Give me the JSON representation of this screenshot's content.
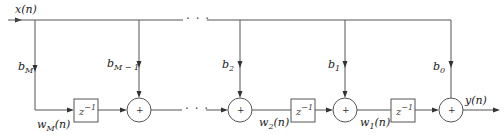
{
  "diagram": {
    "type": "transposed direct-form FIR/IIR filter structure (block diagram)",
    "input_label": "x(n)",
    "output_label": "y(n)",
    "ellipsis": "· · ·",
    "coefficients": [
      {
        "base": "b",
        "sub": "M"
      },
      {
        "base": "b",
        "sub": "M − 1"
      },
      {
        "base": "b",
        "sub": "2"
      },
      {
        "base": "b",
        "sub": "1"
      },
      {
        "base": "b",
        "sub": "0"
      }
    ],
    "delays": [
      {
        "base": "z",
        "sup": "−1"
      },
      {
        "base": "z",
        "sup": "−1"
      },
      {
        "base": "z",
        "sup": "−1"
      }
    ],
    "states": [
      {
        "base": "w",
        "sub": "M",
        "arg": "(n)"
      },
      {
        "base": "w",
        "sub": "2",
        "arg": "(n)"
      },
      {
        "base": "w",
        "sub": "1",
        "arg": "(n)"
      }
    ],
    "adder_symbol": "+"
  }
}
